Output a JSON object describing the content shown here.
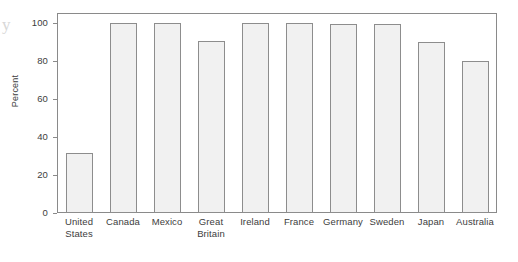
{
  "figure": {
    "margin_artifact": "y",
    "background_color": "#ffffff",
    "frame_color": "#8a8a8a",
    "bar_fill_color": "#f1f1f1",
    "bar_stroke_color": "#8d8d8d"
  },
  "chart_data": {
    "type": "bar",
    "title": "",
    "subtitle": "",
    "xlabel": "",
    "ylabel": "Percent",
    "ylim": [
      0,
      105
    ],
    "ytick_labels": [
      "0",
      "20",
      "40",
      "60",
      "80",
      "100"
    ],
    "ytick_values": [
      0,
      20,
      40,
      60,
      80,
      100
    ],
    "grid": false,
    "legend": false,
    "legend_position": "none",
    "categories": [
      "United States",
      "Canada",
      "Mexico",
      "Great Britain",
      "Ireland",
      "France",
      "Germany",
      "Sweden",
      "Japan",
      "Australia"
    ],
    "category_lines": [
      [
        "United",
        "States"
      ],
      [
        "Canada",
        ""
      ],
      [
        "Mexico",
        ""
      ],
      [
        "Great",
        "Britain"
      ],
      [
        "Ireland",
        ""
      ],
      [
        "France",
        ""
      ],
      [
        "Germany",
        ""
      ],
      [
        "Sweden",
        ""
      ],
      [
        "Japan",
        ""
      ],
      [
        "Australia",
        ""
      ]
    ],
    "values": [
      31.5,
      100,
      99.8,
      90.5,
      99.6,
      99.5,
      99.3,
      99.2,
      89.8,
      79.7
    ],
    "annotations": []
  }
}
